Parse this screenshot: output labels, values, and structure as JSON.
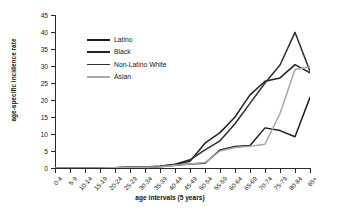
{
  "chart_data": {
    "type": "line",
    "title": "",
    "xlabel": "age intervals (5 years)",
    "ylabel": "age-specific incidence rate",
    "ylim": [
      0,
      45
    ],
    "yticks": [
      0,
      5,
      10,
      15,
      20,
      25,
      30,
      35,
      40,
      45
    ],
    "grid": false,
    "legend_position": "upper-left-inside",
    "categories": [
      "0-4",
      "5-9",
      "10-14",
      "15-19",
      "20-24",
      "25-29",
      "30-34",
      "35-39",
      "40-44",
      "45-49",
      "50-54",
      "55-59",
      "60-64",
      "65-69",
      "70-74",
      "75-79",
      "80-84",
      "65+"
    ],
    "series": [
      {
        "name": "Latino",
        "color": "#1c1c1c",
        "values": [
          0.0,
          0.0,
          0.0,
          0.0,
          0.1,
          0.2,
          0.2,
          0.4,
          0.8,
          1.2,
          1.4,
          5.3,
          6.3,
          6.6,
          11.8,
          11.0,
          9.2,
          20.8
        ]
      },
      {
        "name": "Black",
        "color": "#232323",
        "values": [
          0.0,
          0.0,
          0.0,
          0.0,
          0.1,
          0.2,
          0.3,
          0.5,
          1.0,
          2.0,
          7.3,
          10.4,
          15.0,
          21.5,
          25.5,
          26.5,
          30.4,
          28.0
        ]
      },
      {
        "name": "Non-Latino White",
        "color": "#2e2e2e",
        "values": [
          0.0,
          0.0,
          0.0,
          0.0,
          0.1,
          0.2,
          0.3,
          0.5,
          1.1,
          2.4,
          5.3,
          8.0,
          13.0,
          19.0,
          25.0,
          30.3,
          39.9,
          28.4
        ]
      },
      {
        "name": "Asian",
        "color": "#a8a8a8",
        "values": [
          0.0,
          0.0,
          0.0,
          0.0,
          0.1,
          0.2,
          0.2,
          0.4,
          0.8,
          1.2,
          1.6,
          5.0,
          6.0,
          6.4,
          7.0,
          16.0,
          29.0,
          29.8
        ]
      }
    ]
  }
}
